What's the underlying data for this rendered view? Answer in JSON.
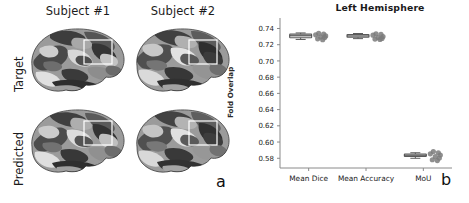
{
  "panel_a": {
    "letter": "a",
    "column_headers": [
      "Subject #1",
      "Subject #2"
    ],
    "row_labels": [
      "Target",
      "Predicted"
    ],
    "cells": [
      {
        "row": "Target",
        "column": "Subject #1",
        "image": "brain-surface-lateral-parcellation"
      },
      {
        "row": "Target",
        "column": "Subject #2",
        "image": "brain-surface-lateral-parcellation"
      },
      {
        "row": "Predicted",
        "column": "Subject #1",
        "image": "brain-surface-lateral-parcellation"
      },
      {
        "row": "Predicted",
        "column": "Subject #2",
        "image": "brain-surface-lateral-parcellation"
      }
    ],
    "highlight_box_color": "#ffffff"
  },
  "panel_b": {
    "letter": "b"
  },
  "chart_data": {
    "type": "box",
    "title": "Left Hemisphere",
    "xlabel": "",
    "ylabel": "Fold Overlap",
    "ylim": [
      0.568,
      0.748
    ],
    "yticks": [
      0.58,
      0.6,
      0.62,
      0.64,
      0.66,
      0.68,
      0.7,
      0.72,
      0.74
    ],
    "ytick_labels": [
      "0.58",
      "0.60",
      "0.62",
      "0.64",
      "0.66",
      "0.68",
      "0.70",
      "0.72",
      "0.74"
    ],
    "categories": [
      "Mean Dice",
      "Mean Accuracy",
      "MoU"
    ],
    "grid": false,
    "legend": null,
    "box_color": "#ffffff",
    "box_edge_color": "#5a5a5a",
    "point_color": "#7b7b7b",
    "boxes": [
      {
        "category": "Mean Dice",
        "q1": 0.7285,
        "median": 0.731,
        "q3": 0.733,
        "whisker_low": 0.7265,
        "whisker_high": 0.7345,
        "points": [
          0.734,
          0.733,
          0.7322,
          0.7308,
          0.7295,
          0.7288,
          0.7272,
          0.7262
        ]
      },
      {
        "category": "Mean Accuracy",
        "q1": 0.7292,
        "median": 0.7308,
        "q3": 0.7325,
        "whisker_low": 0.7275,
        "whisker_high": 0.7338,
        "points": [
          0.7335,
          0.7328,
          0.7318,
          0.73,
          0.7288,
          0.7278,
          0.727,
          0.7264
        ]
      },
      {
        "category": "MoU",
        "q1": 0.5822,
        "median": 0.5838,
        "q3": 0.5852,
        "whisker_low": 0.58,
        "whisker_high": 0.5868,
        "points": [
          0.5882,
          0.5868,
          0.5855,
          0.584,
          0.582,
          0.5802,
          0.5782,
          0.5772
        ]
      }
    ]
  }
}
